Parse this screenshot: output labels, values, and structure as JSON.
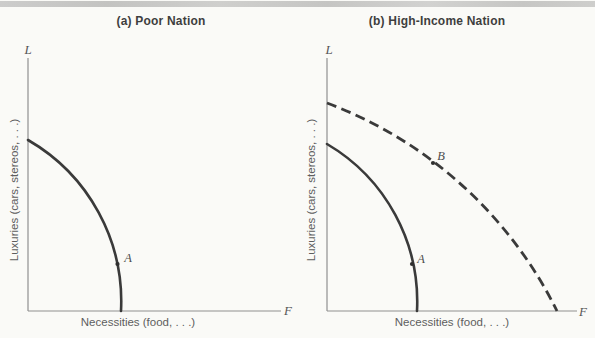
{
  "panels": [
    {
      "title": "(a) Poor Nation",
      "y_letter": "L",
      "x_letter": "F",
      "y_label": "Luxuries (cars, stereos, . . .)",
      "x_label": "Necessities (food, . . .)",
      "points": [
        {
          "label": "A"
        }
      ]
    },
    {
      "title": "(b) High-Income Nation",
      "y_letter": "L",
      "x_letter": "F",
      "y_label": "Luxuries (cars, stereos, . . .)",
      "x_label": "Necessities (food, . . .)",
      "points": [
        {
          "label": "A"
        },
        {
          "label": "B"
        }
      ]
    }
  ],
  "chart_data": [
    {
      "type": "line",
      "title": "(a) Poor Nation",
      "xlabel": "Necessities (food, . . .)",
      "ylabel": "Luxuries (cars, stereos, . . .)",
      "x_axis_end_letter": "F",
      "y_axis_end_letter": "L",
      "axis_tick_labels": "none (qualitative production-possibilities diagram)",
      "grid": false,
      "legend": "none",
      "series": [
        {
          "name": "production possibilities frontier",
          "style": "solid",
          "shape": "concave bowed-out frontier",
          "points_fraction_of_axis": [
            [
              0.0,
              0.67
            ],
            [
              0.15,
              0.58
            ],
            [
              0.26,
              0.45
            ],
            [
              0.33,
              0.28
            ],
            [
              0.354,
              0.185
            ],
            [
              0.37,
              0.0
            ]
          ]
        }
      ],
      "annotations": [
        {
          "label": "A",
          "x_fraction": 0.354,
          "y_fraction": 0.185,
          "marker": "dot on frontier"
        }
      ]
    },
    {
      "type": "line",
      "title": "(b) High-Income Nation",
      "xlabel": "Necessities (food, . . .)",
      "ylabel": "Luxuries (cars, stereos, . . .)",
      "x_axis_end_letter": "F",
      "y_axis_end_letter": "L",
      "axis_tick_labels": "none (qualitative production-possibilities diagram)",
      "grid": false,
      "legend": "none",
      "series": [
        {
          "name": "initial production possibilities frontier",
          "style": "solid",
          "shape": "concave bowed-out frontier",
          "points_fraction_of_axis": [
            [
              0.0,
              0.66
            ],
            [
              0.14,
              0.56
            ],
            [
              0.25,
              0.42
            ],
            [
              0.34,
              0.185
            ],
            [
              0.36,
              0.0
            ]
          ]
        },
        {
          "name": "expanded production possibilities frontier",
          "style": "dashed",
          "shape": "concave bowed-out frontier",
          "points_fraction_of_axis": [
            [
              0.0,
              0.82
            ],
            [
              0.2,
              0.72
            ],
            [
              0.426,
              0.587
            ],
            [
              0.62,
              0.4
            ],
            [
              0.8,
              0.18
            ],
            [
              0.92,
              0.0
            ]
          ]
        }
      ],
      "annotations": [
        {
          "label": "A",
          "x_fraction": 0.34,
          "y_fraction": 0.185,
          "marker": "dot on solid frontier"
        },
        {
          "label": "B",
          "x_fraction": 0.426,
          "y_fraction": 0.587,
          "marker": "dot on dashed frontier"
        }
      ]
    }
  ],
  "render": {
    "width": 595,
    "height": 338,
    "colors": {
      "curve": "#3a3a3a",
      "axis": "#8f8f8f",
      "dot": "#2f2f2f"
    },
    "panels": [
      {
        "name": "panel-a",
        "axes": {
          "origin_x": 28,
          "origin_y": 311,
          "x_end": 281,
          "y_top": 58
        },
        "curves": [
          {
            "name": "ppf-poor-nation",
            "style": "solid",
            "path": "M 28 140 A 186.5 186.5 0 0 1 121 311"
          }
        ],
        "dots": [
          {
            "x": 117.5,
            "y": 264
          }
        ]
      },
      {
        "name": "panel-b",
        "axes": {
          "origin_x": 327,
          "origin_y": 311,
          "x_end": 577,
          "y_top": 58
        },
        "curves": [
          {
            "name": "ppf-high-income-initial",
            "style": "solid",
            "path": "M 327 144 A 183 183 0 0 1 417 311"
          },
          {
            "name": "ppf-high-income-expanded",
            "style": "dashed",
            "path": "M 327 103 A 421.5 421.5 0 0 1 557 311"
          }
        ],
        "dots": [
          {
            "x": 412,
            "y": 264
          },
          {
            "x": 433,
            "y": 163
          }
        ]
      }
    ]
  }
}
